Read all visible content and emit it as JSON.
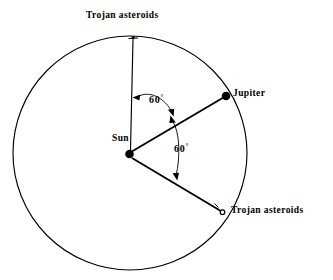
{
  "figure": {
    "type": "diagram",
    "background_color": "#ffffff",
    "stroke_color": "#000000"
  },
  "labels": {
    "trojan_top": "Trojan asteroids",
    "trojan_bottom": "Trojan asteroids",
    "jupiter": "Jupiter",
    "sun": "Sun",
    "angle_upper_value": "60",
    "angle_upper_unit": "°",
    "angle_lower_value": "60",
    "angle_lower_unit": "°"
  },
  "geometry": {
    "orbit": {
      "name": "jupiter-orbit",
      "center_x": 130,
      "center_y": 153,
      "radius": 117
    },
    "bodies": [
      {
        "name": "sun",
        "x": 129,
        "y": 154,
        "marker": "filled-circle",
        "radius": 4.2
      },
      {
        "name": "jupiter",
        "x": 226,
        "y": 96,
        "marker": "filled-circle",
        "radius": 4.2
      },
      {
        "name": "trojan-leading",
        "x": 133,
        "y": 38,
        "marker": "small-tick",
        "radius": 1.6
      },
      {
        "name": "trojan-trailing",
        "x": 222,
        "y": 212,
        "marker": "open-circle",
        "radius": 2.2
      }
    ],
    "radial_lines": [
      {
        "name": "sun-to-trojan-leading",
        "x1": 130,
        "y1": 150,
        "x2": 133,
        "y2": 38
      },
      {
        "name": "sun-to-jupiter",
        "x1": 131,
        "y1": 152,
        "x2": 226,
        "y2": 96
      },
      {
        "name": "sun-to-trojan-trailing",
        "x1": 132,
        "y1": 158,
        "x2": 222,
        "y2": 212
      }
    ],
    "angle_arcs": [
      {
        "name": "angle-arc-upper",
        "path": "M 135.5 97.5 C 147 90 163 95 172.5 112.5",
        "arrow_start": true,
        "arrow_end": true
      },
      {
        "name": "angle-arc-lower",
        "path": "M 173.5 119 C 182 131 181 159 176.5 177.5",
        "arrow_start": true,
        "arrow_end": true
      }
    ]
  }
}
